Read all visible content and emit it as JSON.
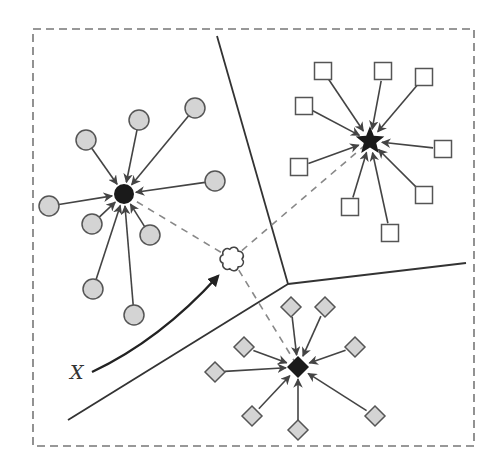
{
  "diagram": {
    "title": "",
    "query_label": "X",
    "colors": {
      "stroke": "#444444",
      "boundary": "#333333",
      "dashed": "#888888",
      "node_fill": "#d4d4d4",
      "square_fill": "#ffffff",
      "hub_fill": "#1a1a1a"
    },
    "frame": {
      "x": 33,
      "y": 29,
      "width": 441,
      "height": 417
    },
    "boundaries": [
      {
        "x1": 217,
        "y1": 36,
        "x2": 288,
        "y2": 284
      },
      {
        "x1": 288,
        "y1": 284,
        "x2": 466,
        "y2": 263
      },
      {
        "x1": 288,
        "y1": 284,
        "x2": 68,
        "y2": 420
      }
    ],
    "clusters": [
      {
        "name": "circles",
        "shape": "circle",
        "hub": {
          "x": 124,
          "y": 194,
          "shape": "circle"
        },
        "members": [
          {
            "x": 86,
            "y": 140
          },
          {
            "x": 139,
            "y": 120
          },
          {
            "x": 195,
            "y": 108
          },
          {
            "x": 215,
            "y": 181
          },
          {
            "x": 49,
            "y": 206
          },
          {
            "x": 92,
            "y": 224
          },
          {
            "x": 150,
            "y": 235
          },
          {
            "x": 93,
            "y": 289
          },
          {
            "x": 134,
            "y": 315
          }
        ]
      },
      {
        "name": "squares",
        "shape": "square",
        "hub": {
          "x": 370,
          "y": 141,
          "shape": "star"
        },
        "members": [
          {
            "x": 323,
            "y": 71
          },
          {
            "x": 383,
            "y": 71
          },
          {
            "x": 424,
            "y": 77
          },
          {
            "x": 304,
            "y": 106
          },
          {
            "x": 299,
            "y": 167
          },
          {
            "x": 443,
            "y": 149
          },
          {
            "x": 350,
            "y": 207
          },
          {
            "x": 424,
            "y": 195
          },
          {
            "x": 390,
            "y": 233
          }
        ]
      },
      {
        "name": "diamonds",
        "shape": "diamond",
        "hub": {
          "x": 298,
          "y": 367,
          "shape": "diamond"
        },
        "members": [
          {
            "x": 291,
            "y": 307
          },
          {
            "x": 325,
            "y": 307
          },
          {
            "x": 244,
            "y": 347
          },
          {
            "x": 355,
            "y": 347
          },
          {
            "x": 215,
            "y": 372
          },
          {
            "x": 252,
            "y": 416
          },
          {
            "x": 298,
            "y": 430
          },
          {
            "x": 375,
            "y": 416
          }
        ]
      }
    ],
    "query": {
      "x": 232,
      "y": 259,
      "shape": "cloud"
    },
    "query_arrow": {
      "from": {
        "x": 92,
        "y": 372
      },
      "ctrl": {
        "x": 160,
        "y": 340
      },
      "to": {
        "x": 218,
        "y": 276
      }
    },
    "label_pos": {
      "x": 70,
      "y": 379
    }
  }
}
